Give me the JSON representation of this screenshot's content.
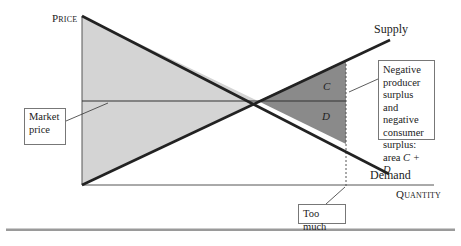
{
  "axes": {
    "y_label": "Price",
    "x_label": "Quantity"
  },
  "curves": {
    "supply_label": "Supply",
    "demand_label": "Demand"
  },
  "areas": {
    "c_label": "C",
    "d_label": "D"
  },
  "callouts": {
    "market_price": "Market price",
    "market_price_line1": "Market",
    "market_price_line2": "price",
    "negative_surplus_lines": [
      "Negative",
      "producer",
      "surplus and",
      "negative",
      "consumer",
      "surplus:",
      "area C + D"
    ],
    "negative_surplus_prefix": "area ",
    "negative_surplus_formula": "C + D",
    "too_much": "Too much"
  },
  "colors": {
    "light_fill": "#d4d4d4",
    "dark_fill": "#8a8a8a",
    "curve": "#222222",
    "rule": "#9a9a9a"
  }
}
